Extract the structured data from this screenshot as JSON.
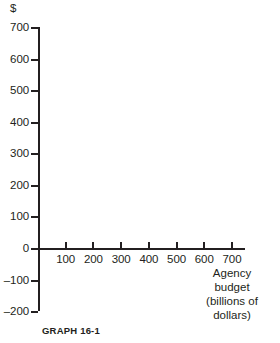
{
  "chart_data": {
    "type": "scatter",
    "title": "",
    "subtitle": "",
    "caption": "GRAPH 16-1",
    "xlabel_lines": [
      "Agency",
      "budget",
      "(billions of",
      "dollars)"
    ],
    "ylabel": "$",
    "x": [],
    "values": [],
    "series": [],
    "xticks": [
      100,
      200,
      300,
      400,
      500,
      600,
      700
    ],
    "xtick_labels": [
      "100",
      "200",
      "300",
      "400",
      "500",
      "600",
      "700"
    ],
    "yticks": [
      700,
      600,
      500,
      400,
      300,
      200,
      100,
      0,
      -100,
      -200
    ],
    "ytick_labels": [
      "700",
      "600",
      "500",
      "400",
      "300",
      "200",
      "100",
      "0",
      "–100",
      "–200"
    ],
    "xlim": [
      0,
      760
    ],
    "ylim": [
      -200,
      700
    ],
    "grid": false,
    "legend": null,
    "annotations": [],
    "axis_color": "#231f20",
    "background_color": "#ffffff",
    "note": "Empty coordinate grid with no plotted data"
  },
  "axes": {
    "y_axis_symbol": "$",
    "x_axis_title": {
      "line1": "Agency",
      "line2": "budget",
      "line3": "(billions of",
      "line4": "dollars)"
    }
  },
  "figure": {
    "caption": "GRAPH 16-1"
  }
}
